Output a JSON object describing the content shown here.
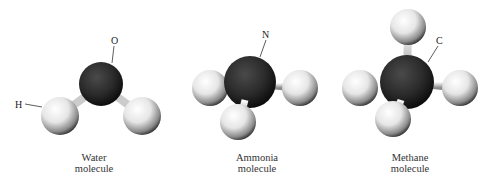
{
  "molecules": [
    {
      "name": "water",
      "caption_line1": "Water",
      "caption_line2": "molecule",
      "central_atom": "O",
      "hydrogen_label": "H",
      "hydrogen_count": 2
    },
    {
      "name": "ammonia",
      "caption_line1": "Ammonia",
      "caption_line2": "molecule",
      "central_atom": "N",
      "hydrogen_count": 3
    },
    {
      "name": "methane",
      "caption_line1": "Methane",
      "caption_line2": "molecule",
      "central_atom": "C",
      "hydrogen_count": 4
    }
  ],
  "colors": {
    "central_atom": "#2a2a2a",
    "hydrogen": "#f2f2f2",
    "background": "#ffffff"
  }
}
